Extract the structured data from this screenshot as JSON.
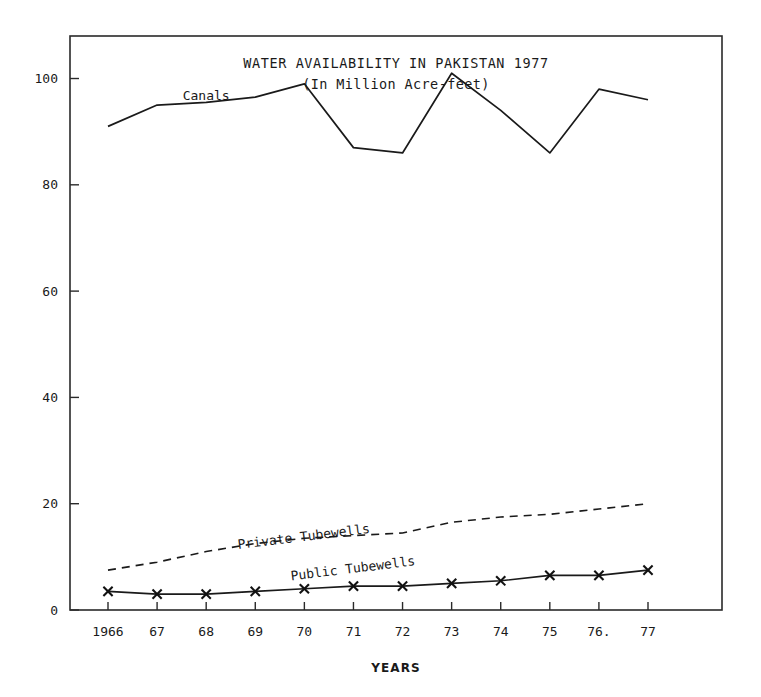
{
  "chart_data": {
    "type": "line",
    "title": "WATER AVAILABILITY IN PAKISTAN  1977",
    "subtitle": "(In Million Acre-feet)",
    "xlabel": "YEARS",
    "ylabel": "",
    "categories": [
      "1966",
      "67",
      "68",
      "69",
      "70",
      "71",
      "72",
      "73",
      "74",
      "75",
      "76",
      "77"
    ],
    "x_tick_labels": [
      "1966",
      "67",
      "68",
      "69",
      "70",
      "71",
      "72",
      "73",
      "74",
      "75",
      "76.",
      "77"
    ],
    "y_tick_labels": [
      "0",
      "20",
      "40",
      "60",
      "80",
      "100"
    ],
    "y_ticks": [
      0,
      20,
      40,
      60,
      80,
      100
    ],
    "ylim": [
      0,
      108
    ],
    "xlim": [
      0,
      11
    ],
    "grid": false,
    "legend": "inline-labels",
    "series": [
      {
        "name": "Canals",
        "style": "solid",
        "marker": "none",
        "color": "#1a1a1a",
        "values": [
          91,
          95,
          95.5,
          96.5,
          99,
          87,
          86,
          101,
          94,
          86,
          98,
          96
        ]
      },
      {
        "name": "Private Tubewells",
        "style": "dashed",
        "marker": "none",
        "color": "#1a1a1a",
        "values": [
          7.5,
          9,
          11,
          12.5,
          13.5,
          14,
          14.5,
          16.5,
          17.5,
          18,
          19,
          20
        ]
      },
      {
        "name": "Public Tubewells",
        "style": "solid",
        "marker": "x",
        "color": "#1a1a1a",
        "values": [
          3.5,
          3,
          3,
          3.5,
          4,
          4.5,
          4.5,
          5,
          5.5,
          6.5,
          6.5,
          7.5
        ]
      }
    ],
    "annotations": [
      {
        "text": "Canals",
        "x_index": 2,
        "value": 96,
        "rotation": 0
      },
      {
        "text": "Private Tubewells",
        "x_index": 4,
        "value": 13,
        "rotation": -7
      },
      {
        "text": "Public Tubewells",
        "x_index": 5,
        "value": 7,
        "rotation": -7
      }
    ]
  }
}
